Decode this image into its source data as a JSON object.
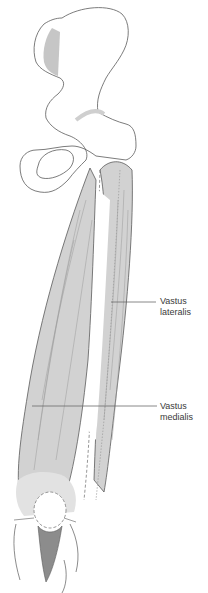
{
  "diagram": {
    "labels": [
      {
        "line1": "Vastus",
        "line2": "lateralis",
        "x": 160,
        "y": 296,
        "leader": {
          "x1": 111,
          "y1": 302,
          "x2": 156,
          "y2": 302
        }
      },
      {
        "line1": "Vastus",
        "line2": "medialis",
        "x": 160,
        "y": 401,
        "leader": {
          "x1": 32,
          "y1": 406,
          "x2": 157,
          "y2": 406
        }
      }
    ],
    "colors": {
      "outline": "#5a5a5a",
      "bone_fill": "#ffffff",
      "bone_shade": "#dcdcdc",
      "muscle_fill": "#d2d2d2",
      "muscle_stripe": "#9a9a9a",
      "tendon_dark": "#8c8c8c",
      "iliac_shade": "#b8b8b8",
      "leader": "#6a6a6a",
      "text": "#3a3a3a"
    }
  }
}
